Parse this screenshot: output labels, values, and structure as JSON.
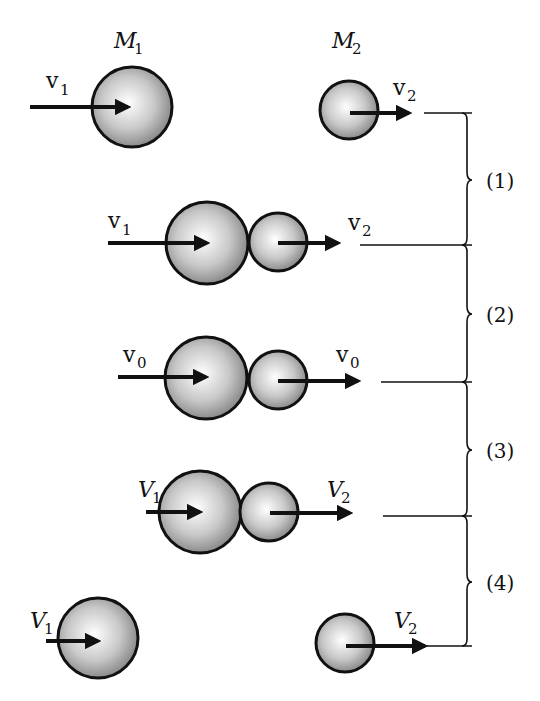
{
  "diagram": {
    "title_labels": {
      "mass1": {
        "base": "M",
        "sub": "1"
      },
      "mass2": {
        "base": "M",
        "sub": "2"
      }
    },
    "rows": [
      {
        "stage": "before collision",
        "left_label": {
          "base": "v",
          "sub": "1"
        },
        "right_label": {
          "base": "v",
          "sub": "2"
        }
      },
      {
        "stage": "contact begins",
        "left_label": {
          "base": "v",
          "sub": "1"
        },
        "right_label": {
          "base": "v",
          "sub": "2"
        }
      },
      {
        "stage": "maximum compression",
        "left_label": {
          "base": "v",
          "sub": "0"
        },
        "right_label": {
          "base": "v",
          "sub": "0"
        }
      },
      {
        "stage": "separation",
        "left_label": {
          "base": "V",
          "sub": "1"
        },
        "right_label": {
          "base": "V",
          "sub": "2"
        }
      },
      {
        "stage": "after collision",
        "left_label": {
          "base": "V",
          "sub": "1"
        },
        "right_label": {
          "base": "V",
          "sub": "2"
        }
      }
    ],
    "intervals": [
      "(1)",
      "(2)",
      "(3)",
      "(4)"
    ],
    "colors": {
      "stroke": "#111111",
      "ball_light": "#ffffff",
      "ball_dark": "#8a8a8a"
    }
  }
}
